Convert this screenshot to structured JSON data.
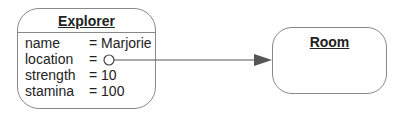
{
  "diagram": {
    "type": "object-diagram",
    "nodes": [
      {
        "id": "explorer",
        "title": "Explorer",
        "attributes": [
          {
            "name": "name",
            "value": "= Marjorie"
          },
          {
            "name": "location",
            "value": "="
          },
          {
            "name": "strength",
            "value": "= 10"
          },
          {
            "name": "stamina",
            "value": "= 100"
          }
        ]
      },
      {
        "id": "room",
        "title": "Room",
        "attributes": []
      }
    ],
    "edges": [
      {
        "from": "explorer.location",
        "to": "room",
        "style": "reference-arrow",
        "start_marker": "open-circle",
        "end_marker": "filled-arrowhead"
      }
    ],
    "colors": {
      "border": "#888888",
      "line": "#555555",
      "text": "#222222"
    }
  }
}
